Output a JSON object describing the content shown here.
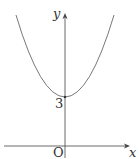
{
  "diagram": {
    "type": "function-graph",
    "function": "parabola opening upward",
    "axes": {
      "x_label": "x",
      "y_label": "y",
      "origin_label": "O"
    },
    "y_intercept_label": "3",
    "colors": {
      "axis": "#444444",
      "curve": "#555555",
      "text": "#333333"
    }
  }
}
